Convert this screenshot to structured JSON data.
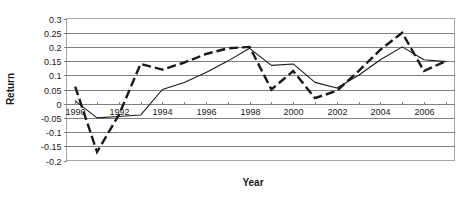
{
  "chart_data": {
    "type": "line",
    "title": "",
    "xlabel": "Year",
    "ylabel": "Return",
    "xlim": [
      1989.6,
      2007.4
    ],
    "ylim": [
      -0.2,
      0.3
    ],
    "grid": true,
    "legend": "none",
    "y_ticks": [
      0.3,
      0.25,
      0.2,
      0.15,
      0.1,
      0.05,
      0,
      -0.05,
      -0.1,
      -0.15,
      -0.2
    ],
    "y_tick_labels": [
      "0.3",
      "0.25",
      "0.2",
      "0.15",
      "0.1",
      "0.05",
      "0",
      "-0.05",
      "-0.1",
      "-0.15",
      "-0.2"
    ],
    "x_ticks": [
      1990,
      1991,
      1992,
      1993,
      1994,
      1995,
      1996,
      1997,
      1998,
      1999,
      2000,
      2001,
      2002,
      2003,
      2004,
      2005,
      2006,
      2007
    ],
    "x_tick_labels_shown": [
      "1990",
      "1992",
      "1994",
      "1996",
      "1998",
      "2000",
      "2002",
      "2004",
      "2006"
    ],
    "x": [
      1990,
      1991,
      1992,
      1993,
      1994,
      1995,
      1996,
      1997,
      1998,
      1999,
      2000,
      2001,
      2002,
      2003,
      2004,
      2005,
      2006,
      2007
    ],
    "series": [
      {
        "name": "dashed-series",
        "style": "dashed",
        "color": "#1a1a1a",
        "values": [
          0.06,
          -0.17,
          -0.04,
          0.14,
          0.12,
          0.145,
          0.175,
          0.195,
          0.2,
          0.05,
          0.115,
          0.02,
          0.045,
          0.115,
          0.19,
          0.25,
          0.115,
          0.15
        ]
      },
      {
        "name": "solid-series",
        "style": "solid",
        "color": "#1a1a1a",
        "values": [
          0.01,
          -0.05,
          -0.045,
          -0.04,
          0.05,
          0.075,
          0.11,
          0.15,
          0.195,
          0.135,
          0.14,
          0.075,
          0.055,
          0.1,
          0.155,
          0.2,
          0.155,
          0.148
        ]
      }
    ]
  }
}
